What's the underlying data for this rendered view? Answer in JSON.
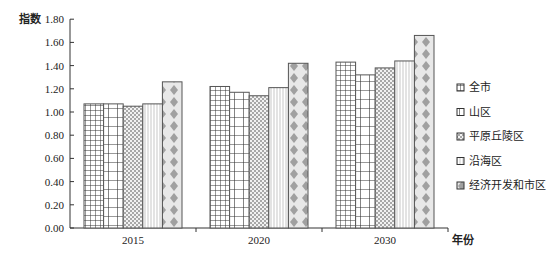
{
  "chart_data": {
    "type": "bar",
    "title": "",
    "xlabel": "年份",
    "ylabel": "指数",
    "ylim": [
      0,
      1.8
    ],
    "yticks": [
      "0.00",
      "0.20",
      "0.40",
      "0.60",
      "0.80",
      "1.00",
      "1.20",
      "1.40",
      "1.60",
      "1.80"
    ],
    "categories": [
      "2015",
      "2020",
      "2030"
    ],
    "grid": false,
    "legend_position": "right",
    "series": [
      {
        "name": "全市",
        "pattern": "grid",
        "values": [
          1.07,
          1.22,
          1.43
        ]
      },
      {
        "name": "山区",
        "pattern": "large-grid",
        "values": [
          1.07,
          1.17,
          1.32
        ]
      },
      {
        "name": "平原丘陵区",
        "pattern": "checker",
        "values": [
          1.05,
          1.14,
          1.38
        ]
      },
      {
        "name": "沿海区",
        "pattern": "vertical-lines",
        "values": [
          1.07,
          1.21,
          1.44
        ]
      },
      {
        "name": "经济开发和市区",
        "pattern": "diamonds",
        "values": [
          1.26,
          1.42,
          1.66
        ]
      }
    ]
  },
  "labels": {
    "y_axis_title": "指数",
    "x_axis_title": "年份"
  }
}
